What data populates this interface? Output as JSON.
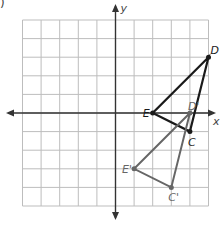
{
  "figure": {
    "corner_mark": ")",
    "axes": {
      "x_label": "x",
      "y_label": "y",
      "range": [
        -5,
        5
      ]
    },
    "grid": {
      "min": -5,
      "max": 5,
      "step": 1,
      "color": "#bdbdbd"
    },
    "triangles": [
      {
        "name": "original",
        "color": "#1a1a1a",
        "vertices": [
          {
            "label": "D",
            "x": 5,
            "y": 3
          },
          {
            "label": "E",
            "x": 2,
            "y": 0
          },
          {
            "label": "C",
            "x": 4,
            "y": -1
          }
        ]
      },
      {
        "name": "image",
        "color": "#666666",
        "vertices": [
          {
            "label": "D'",
            "x": 4,
            "y": 0
          },
          {
            "label": "E'",
            "x": 1,
            "y": -3
          },
          {
            "label": "C'",
            "x": 3,
            "y": -4
          }
        ]
      }
    ]
  }
}
